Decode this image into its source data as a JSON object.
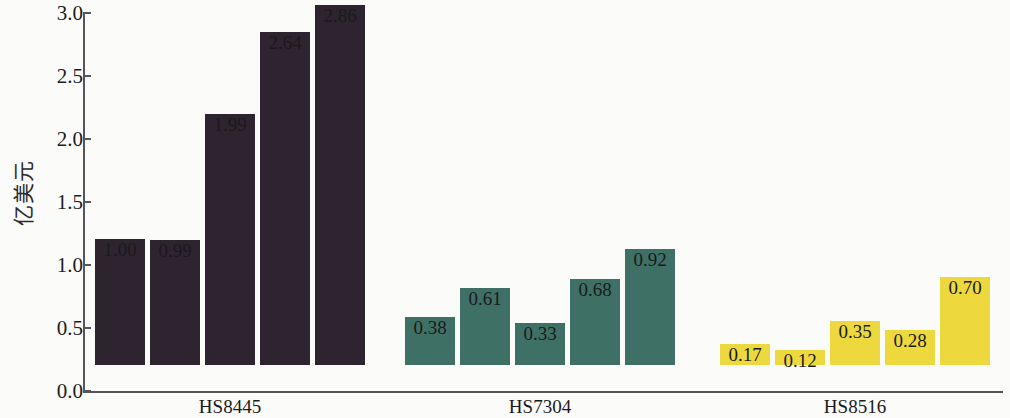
{
  "chart_data": {
    "type": "bar",
    "title": "",
    "subtitle": "",
    "xlabel": "",
    "ylabel": "亿美元",
    "ylim": [
      0.0,
      3.0
    ],
    "ytick_labels": [
      "0.0",
      "0.5",
      "1.0",
      "1.5",
      "2.0",
      "2.5",
      "3.0"
    ],
    "ytick_values": [
      0.0,
      0.5,
      1.0,
      1.5,
      2.0,
      2.5,
      3.0
    ],
    "grid": false,
    "legend": "none",
    "categories": [
      "HS8445",
      "HS7304",
      "HS8516"
    ],
    "groups": [
      {
        "name": "HS8445",
        "color": "#2e2430",
        "values": [
          1.0,
          0.99,
          1.99,
          2.64,
          2.86
        ],
        "value_labels": [
          "1.00",
          "0.99",
          "1.99",
          "2.64",
          "2.86"
        ]
      },
      {
        "name": "HS7304",
        "color": "#3f7066",
        "values": [
          0.38,
          0.61,
          0.33,
          0.68,
          0.92
        ],
        "value_labels": [
          "0.38",
          "0.61",
          "0.33",
          "0.68",
          "0.92"
        ]
      },
      {
        "name": "HS8516",
        "color": "#edd93e",
        "values": [
          0.17,
          0.12,
          0.35,
          0.28,
          0.7
        ],
        "value_labels": [
          "0.17",
          "0.12",
          "0.35",
          "0.28",
          "0.70"
        ]
      }
    ]
  },
  "axis": {
    "line_color": "#55555a",
    "background": "#fbfbf9",
    "text_color": "#1a1a1a"
  }
}
